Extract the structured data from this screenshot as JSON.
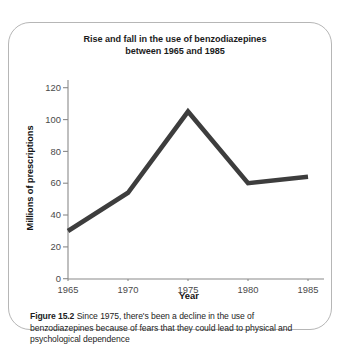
{
  "figure": {
    "caption_label": "Figure 15.2",
    "caption_text": "Since 1975, there's been a decline in the use of benzodiazepines because of fears that they could lead to physical and psychological dependence"
  },
  "colors": {
    "line": "#3d3d3d",
    "axis": "#8a8a8a",
    "border": "#b6b6b6",
    "text": "#1b1b1b",
    "tick_text": "#4a4a4a"
  },
  "chart_data": {
    "type": "line",
    "title": "Rise and fall in the use of benzodiazepines between 1965 and 1985",
    "title_line1": "Rise and fall in the use of benzodiazepines",
    "title_line2": "between 1965 and 1985",
    "xlabel": "Year",
    "ylabel": "Millions of prescriptions",
    "x": [
      1965,
      1970,
      1975,
      1980,
      1985
    ],
    "values": [
      30,
      54,
      105,
      60,
      64
    ],
    "series": [
      {
        "name": "Millions of prescriptions",
        "values": [
          30,
          54,
          105,
          60,
          64
        ]
      }
    ],
    "xticks": [
      "1965",
      "1970",
      "1975",
      "1980",
      "1985"
    ],
    "yticks": [
      "0",
      "20",
      "40",
      "60",
      "80",
      "100",
      "120"
    ],
    "xlim": [
      1965,
      1985
    ],
    "ylim": [
      0,
      120
    ],
    "grid": false,
    "legend": false
  }
}
